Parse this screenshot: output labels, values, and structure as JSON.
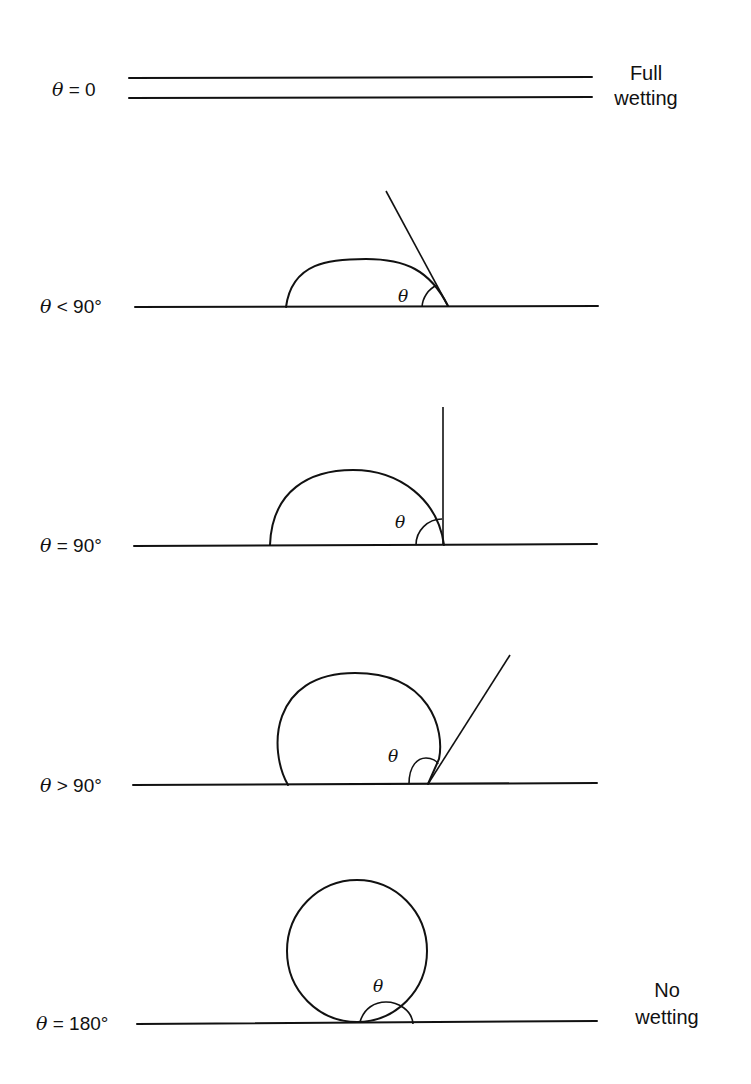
{
  "figure": {
    "panels": [
      {
        "id": "full-wetting",
        "label_symbol": "θ",
        "label_relation": "= 0",
        "angle_symbol": "",
        "note_line1": "Full",
        "note_line2": "wetting"
      },
      {
        "id": "partial-wetting-acute",
        "label_symbol": "θ",
        "label_relation": "< 90°",
        "angle_symbol": "θ",
        "note_line1": "",
        "note_line2": ""
      },
      {
        "id": "right-angle",
        "label_symbol": "θ",
        "label_relation": "= 90°",
        "angle_symbol": "θ",
        "note_line1": "",
        "note_line2": ""
      },
      {
        "id": "obtuse",
        "label_symbol": "θ",
        "label_relation": "> 90°",
        "angle_symbol": "θ",
        "note_line1": "",
        "note_line2": ""
      },
      {
        "id": "no-wetting",
        "label_symbol": "θ",
        "label_relation": "= 180°",
        "angle_symbol": "θ",
        "note_line1": "No",
        "note_line2": "wetting"
      }
    ]
  },
  "colors": {
    "ink": "#111111",
    "background": "#ffffff"
  }
}
